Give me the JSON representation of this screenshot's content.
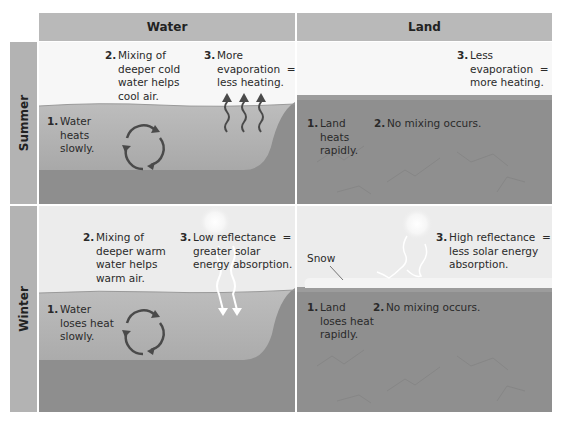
{
  "columns": [
    {
      "label": "Water"
    },
    {
      "label": "Land"
    }
  ],
  "rows": [
    {
      "label": "Summer"
    },
    {
      "label": "Winter"
    }
  ],
  "summer": {
    "water": {
      "item1": {
        "num": "1.",
        "text": "Water\nheats\nslowly."
      },
      "item2": {
        "num": "2.",
        "text": "Mixing of\ndeeper cold\nwater helps\ncool air."
      },
      "item3": {
        "num": "3.",
        "text": "More\nevaporation  =\nless heating."
      }
    },
    "land": {
      "item1": {
        "num": "1.",
        "text": "Land\nheats\nrapidly."
      },
      "item2": {
        "num": "2.",
        "text": "No mixing occurs."
      },
      "item3": {
        "num": "3.",
        "text": "Less\nevaporation  =\nmore heating."
      }
    }
  },
  "winter": {
    "water": {
      "item1": {
        "num": "1.",
        "text": "Water\nloses heat\nslowly."
      },
      "item2": {
        "num": "2.",
        "text": "Mixing of\ndeeper warm\nwater helps\nwarm air."
      },
      "item3": {
        "num": "3.",
        "text": "Low reflectance  =\ngreater solar\nenergy absorption."
      }
    },
    "land": {
      "snow_label": "Snow",
      "item1": {
        "num": "1.",
        "text": "Land\nloses heat\nrapidly."
      },
      "item2": {
        "num": "2.",
        "text": "No mixing occurs."
      },
      "item3": {
        "num": "3.",
        "text": "High reflectance  =\nless solar energy\nabsorption."
      }
    }
  },
  "colors": {
    "header_bg": "#b9b9b9",
    "row_header_bg": "#b3b3b3",
    "summer_sky": "#f7f7f7",
    "winter_sky": "#ececec",
    "water": "#a9a9a9",
    "ground": "#8f8f8f",
    "snow": "#f4f4f4",
    "arrow": "#4a4a4a"
  }
}
